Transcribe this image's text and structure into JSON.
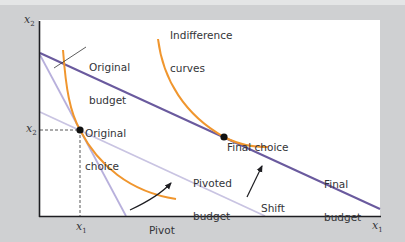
{
  "diagram": {
    "axes": {
      "x_label": "x",
      "x_label_sub": "1",
      "y_label": "x",
      "y_label_sub": "2",
      "x_tick_label": "x",
      "x_tick_sub": "1",
      "y_tick_label": "x",
      "y_tick_sub": "2"
    },
    "labels": {
      "indifference_curves_line1": "Indifference",
      "indifference_curves_line2": "curves",
      "original_budget_line1": "Original",
      "original_budget_line2": "budget",
      "original_choice_line1": "Original",
      "original_choice_line2": "choice",
      "final_choice": "Final choice",
      "pivoted_budget_line1": "Pivoted",
      "pivoted_budget_line2": "budget",
      "final_budget_line1": "Final",
      "final_budget_line2": "budget",
      "pivot": "Pivot",
      "shift": "Shift"
    },
    "colors": {
      "background": "#cfd0d2",
      "panel": "#ffffff",
      "axis": "#1e1e22",
      "final_budget": "#6a5a9e",
      "original_budget": "#b8b0dc",
      "pivoted_budget": "#c9c4e2",
      "indifference_curve": "#f0962e",
      "point": "#111111"
    },
    "points": [
      {
        "name": "Original choice",
        "x": 80,
        "y": 130
      },
      {
        "name": "Final choice",
        "x": 224,
        "y": 137
      }
    ]
  }
}
